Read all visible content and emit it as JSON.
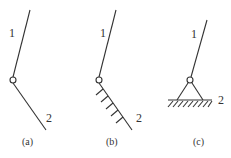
{
  "diagram": {
    "panels": [
      {
        "id": "a",
        "caption": "(a)",
        "label_1": "1",
        "label_2": "2",
        "type": "two links joined by pin"
      },
      {
        "id": "b",
        "caption": "(b)",
        "label_1": "1",
        "label_2": "2",
        "type": "link pinned to hatched frame (inclined)"
      },
      {
        "id": "c",
        "caption": "(c)",
        "label_1": "1",
        "label_2": "2",
        "type": "link pinned to fixed support on ground"
      }
    ],
    "colors": {
      "line": "#333333",
      "background": "#ffffff"
    }
  }
}
